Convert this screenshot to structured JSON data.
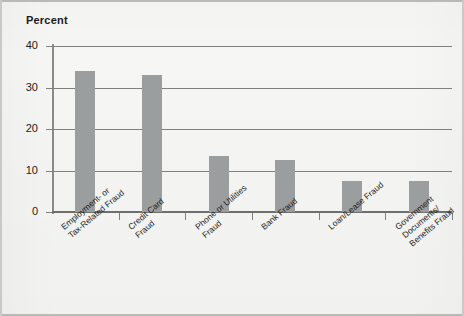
{
  "chart_data": {
    "type": "bar",
    "title": "",
    "subtitle": "",
    "xlabel": "",
    "ylabel": "Percent",
    "ylim": [
      0,
      40
    ],
    "ytick_values": [
      0,
      10,
      20,
      30,
      40
    ],
    "ytick_labels": [
      "0",
      "10",
      "20",
      "30",
      "40"
    ],
    "grid": true,
    "legend": false,
    "legend_position": "none",
    "bar_color": "#9a9e9f",
    "categories": [
      "Employment- or Tax-Related Fraud",
      "Credit Card Fraud",
      "Phone or Utilities Fraud",
      "Bank Fraud",
      "Loan/Lease Fraud",
      "Government Documents/Benefits Fraud"
    ],
    "category_lines": [
      [
        "Employment- or",
        "Tax-Related Fraud"
      ],
      [
        "Credit Card",
        "Fraud"
      ],
      [
        "Phone or Utilities",
        "Fraud"
      ],
      [
        "Bank Fraud"
      ],
      [
        "Loan/Lease Fraud"
      ],
      [
        "Government",
        "Documents/",
        "Benefits Fraud"
      ]
    ],
    "values": [
      34,
      33,
      13.5,
      12.5,
      7.5,
      7.5
    ]
  },
  "figure": {
    "axis_title": "Percent"
  }
}
